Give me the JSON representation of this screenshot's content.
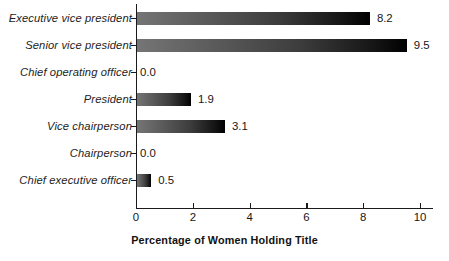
{
  "chart_data": {
    "type": "bar",
    "orientation": "horizontal",
    "title": "",
    "xlabel": "Percentage of Women Holding Title",
    "ylabel": "",
    "xlim": [
      0,
      10.45
    ],
    "xticks": [
      0,
      2,
      4,
      6,
      8,
      10
    ],
    "xtick_labels": [
      "0",
      "2",
      "4",
      "6",
      "8",
      "10"
    ],
    "grid": false,
    "legend": null,
    "categories": [
      "Executive vice president",
      "Senior vice president",
      "Chief operating officer",
      "President",
      "Vice chairperson",
      "Chairperson",
      "Chief executive officer"
    ],
    "values": [
      8.2,
      9.5,
      0.0,
      1.9,
      3.1,
      0.0,
      0.5
    ],
    "value_labels": [
      "8.2",
      "9.5",
      "0.0",
      "1.9",
      "3.1",
      "0.0",
      "0.5"
    ],
    "bar_gradient_start": "#757575",
    "bar_gradient_end": "#000000",
    "bar_shadow_color": "#c9c9c9",
    "axis_color": "#1a1a1a",
    "background": "#ffffff"
  },
  "axis": {
    "x_title": "Percentage of Women Holding Title"
  }
}
